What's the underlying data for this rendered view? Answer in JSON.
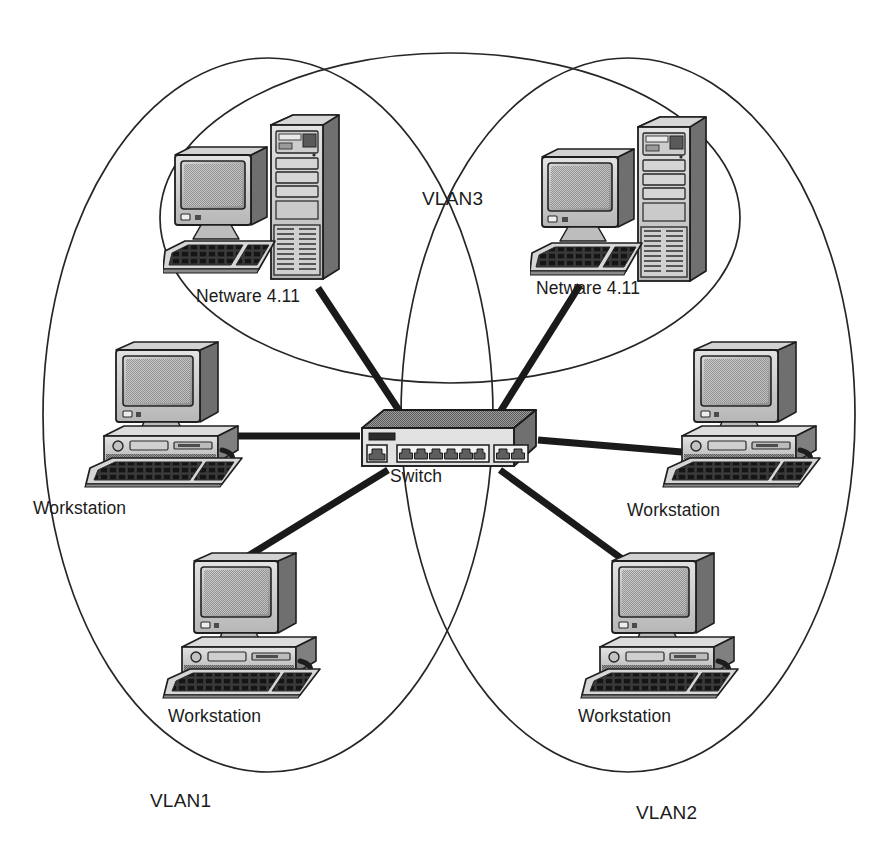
{
  "diagram": {
    "type": "network-topology",
    "background_color": "#ffffff",
    "line_color": "#262626",
    "text_color": "#1b1b1b"
  },
  "vlans": [
    {
      "id": "vlan1",
      "label": "VLAN1",
      "label_x": 150,
      "label_y": 790,
      "shape": "ellipse",
      "cx": 268,
      "cy": 415,
      "rx": 225,
      "ry": 357
    },
    {
      "id": "vlan2",
      "label": "VLAN2",
      "label_x": 636,
      "label_y": 802,
      "shape": "ellipse",
      "cx": 628,
      "cy": 415,
      "rx": 227,
      "ry": 357
    },
    {
      "id": "vlan3",
      "label": "VLAN3",
      "label_x": 422,
      "label_y": 188,
      "shape": "ellipse",
      "cx": 450,
      "cy": 218,
      "rx": 290,
      "ry": 165
    }
  ],
  "devices": [
    {
      "id": "server-left",
      "kind": "server",
      "label": "Netware 4.11",
      "label_x": 196,
      "label_y": 286,
      "x": 163,
      "y": 111,
      "width": 190,
      "height": 180,
      "vlan": "vlan3"
    },
    {
      "id": "server-right",
      "kind": "server",
      "label": "Netware 4.11",
      "label_x": 536,
      "label_y": 278,
      "x": 530,
      "y": 113,
      "width": 190,
      "height": 180,
      "vlan": "vlan3"
    },
    {
      "id": "workstation-top-left",
      "kind": "workstation",
      "label": "Workstation",
      "label_x": 33,
      "label_y": 498,
      "x": 82,
      "y": 334,
      "width": 175,
      "height": 155,
      "vlan": "vlan1"
    },
    {
      "id": "workstation-bottom-left",
      "kind": "workstation",
      "label": "Workstation",
      "label_x": 168,
      "label_y": 706,
      "x": 160,
      "y": 545,
      "width": 175,
      "height": 155,
      "vlan": "vlan1"
    },
    {
      "id": "workstation-top-right",
      "kind": "workstation",
      "label": "Workstation",
      "label_x": 627,
      "label_y": 500,
      "x": 660,
      "y": 334,
      "width": 175,
      "height": 155,
      "vlan": "vlan2"
    },
    {
      "id": "workstation-bottom-right",
      "kind": "workstation",
      "label": "Workstation",
      "label_x": 578,
      "label_y": 706,
      "x": 578,
      "y": 545,
      "width": 175,
      "height": 155,
      "vlan": "vlan2"
    },
    {
      "id": "switch",
      "kind": "switch",
      "label": "Switch",
      "label_x": 390,
      "label_y": 466,
      "x": 358,
      "y": 408,
      "width": 182,
      "height": 62,
      "ports_front": 6,
      "ports_right": 2,
      "ports_left": 1
    }
  ],
  "links": [
    {
      "id": "link-server-left",
      "from": "server-left",
      "to": "switch",
      "x1": 318,
      "y1": 288,
      "x2": 400,
      "y2": 412,
      "width": 7
    },
    {
      "id": "link-server-right",
      "from": "server-right",
      "to": "switch",
      "x1": 580,
      "y1": 285,
      "x2": 500,
      "y2": 412,
      "width": 7
    },
    {
      "id": "link-ws-top-left",
      "from": "workstation-top-left",
      "to": "switch",
      "x1": 208,
      "y1": 436,
      "x2": 360,
      "y2": 436,
      "width": 7
    },
    {
      "id": "link-ws-top-right",
      "from": "workstation-top-right",
      "to": "switch",
      "x1": 538,
      "y1": 440,
      "x2": 682,
      "y2": 452,
      "width": 7
    },
    {
      "id": "link-ws-bot-left",
      "from": "workstation-bottom-left",
      "to": "switch",
      "x1": 222,
      "y1": 572,
      "x2": 388,
      "y2": 470,
      "width": 7
    },
    {
      "id": "link-ws-bot-right",
      "from": "workstation-bottom-right",
      "to": "switch",
      "x1": 640,
      "y1": 572,
      "x2": 500,
      "y2": 470,
      "width": 7
    }
  ]
}
